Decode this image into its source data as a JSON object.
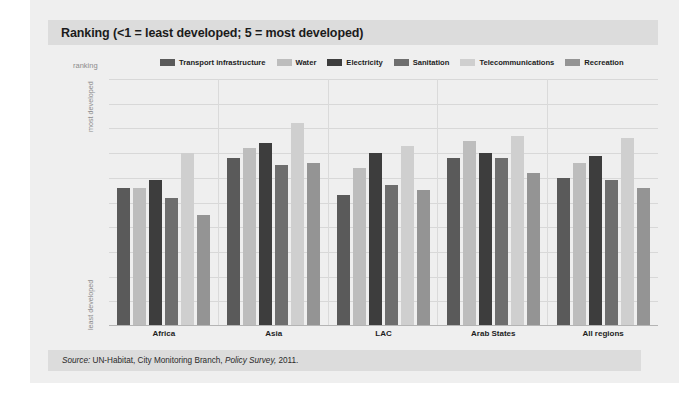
{
  "figure": {
    "title": "Ranking (<1 = least developed; 5 = most developed)",
    "source_prefix": "Source:",
    "source_body": "UN-Habitat, City Monitoring Branch,",
    "source_italic": "Policy Survey,",
    "source_year": "2011.",
    "axis": {
      "ranking_label": "ranking",
      "top_label": "most developed",
      "bottom_label": "least developed"
    }
  },
  "chart_data": {
    "type": "bar",
    "title": "Ranking (<1 = least developed; 5 = most developed)",
    "xlabel": "",
    "ylabel": "ranking",
    "ylim": [
      0,
      5.0
    ],
    "yticks": [
      "5.0",
      "4.5",
      "4.0",
      "3.5",
      "3.0",
      "2.5",
      "2.0",
      "1.5",
      "1.0",
      "0.5",
      "0"
    ],
    "ytick_values": [
      5.0,
      4.5,
      4.0,
      3.5,
      3.0,
      2.5,
      2.0,
      1.5,
      1.0,
      0.5,
      0
    ],
    "grid": true,
    "legend_position": "top",
    "categories": [
      "Africa",
      "Asia",
      "LAC",
      "Arab States",
      "All regions"
    ],
    "series": [
      {
        "name": "Transport infrastructure",
        "color": "#5a5a5a",
        "values": [
          2.8,
          3.4,
          2.65,
          3.4,
          3.0
        ]
      },
      {
        "name": "Water",
        "color": "#bdbdbd",
        "values": [
          2.8,
          3.6,
          3.2,
          3.75,
          3.3
        ]
      },
      {
        "name": "Electricity",
        "color": "#3d3d3d",
        "values": [
          2.95,
          3.7,
          3.5,
          3.5,
          3.45
        ]
      },
      {
        "name": "Sanitation",
        "color": "#6e6e6e",
        "values": [
          2.6,
          3.25,
          2.85,
          3.4,
          2.95
        ]
      },
      {
        "name": "Telecommunications",
        "color": "#cfcfcf",
        "values": [
          3.5,
          4.1,
          3.65,
          3.85,
          3.8
        ]
      },
      {
        "name": "Recreation",
        "color": "#949494",
        "values": [
          2.25,
          3.3,
          2.75,
          3.1,
          2.8
        ]
      }
    ]
  }
}
